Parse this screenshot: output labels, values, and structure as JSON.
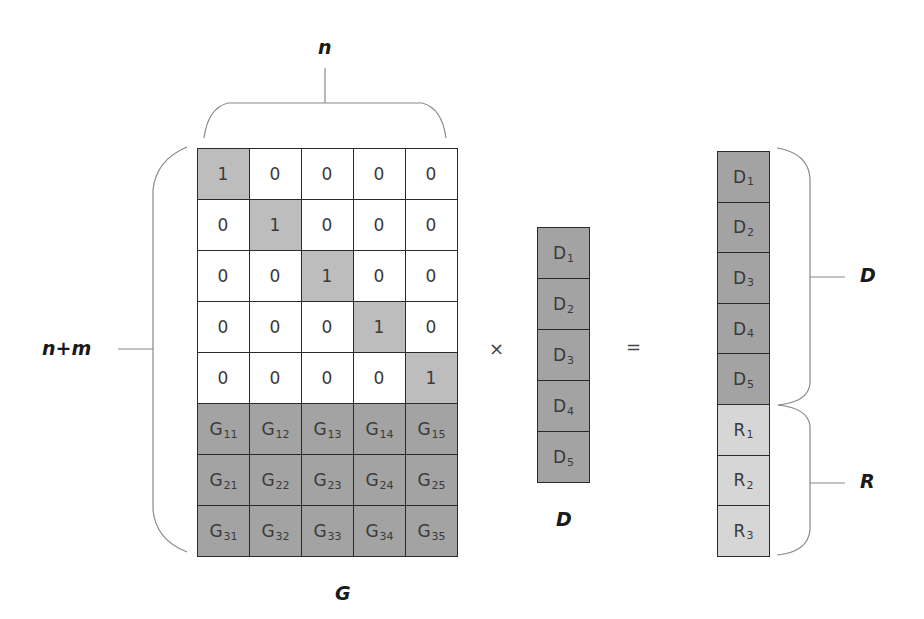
{
  "labels": {
    "n": "n",
    "n_plus_m": "n+m",
    "G": "G",
    "D_vector": "D",
    "D_brace": "D",
    "R_brace": "R",
    "times": "×",
    "equals": "="
  },
  "matrix_G": {
    "rows": [
      [
        {
          "t": "1",
          "s": ""
        },
        {
          "t": "0",
          "s": ""
        },
        {
          "t": "0",
          "s": ""
        },
        {
          "t": "0",
          "s": ""
        },
        {
          "t": "0",
          "s": ""
        }
      ],
      [
        {
          "t": "0",
          "s": ""
        },
        {
          "t": "1",
          "s": ""
        },
        {
          "t": "0",
          "s": ""
        },
        {
          "t": "0",
          "s": ""
        },
        {
          "t": "0",
          "s": ""
        }
      ],
      [
        {
          "t": "0",
          "s": ""
        },
        {
          "t": "0",
          "s": ""
        },
        {
          "t": "1",
          "s": ""
        },
        {
          "t": "0",
          "s": ""
        },
        {
          "t": "0",
          "s": ""
        }
      ],
      [
        {
          "t": "0",
          "s": ""
        },
        {
          "t": "0",
          "s": ""
        },
        {
          "t": "0",
          "s": ""
        },
        {
          "t": "1",
          "s": ""
        },
        {
          "t": "0",
          "s": ""
        }
      ],
      [
        {
          "t": "0",
          "s": ""
        },
        {
          "t": "0",
          "s": ""
        },
        {
          "t": "0",
          "s": ""
        },
        {
          "t": "0",
          "s": ""
        },
        {
          "t": "1",
          "s": ""
        }
      ],
      [
        {
          "t": "G",
          "s": "11"
        },
        {
          "t": "G",
          "s": "12"
        },
        {
          "t": "G",
          "s": "13"
        },
        {
          "t": "G",
          "s": "14"
        },
        {
          "t": "G",
          "s": "15"
        }
      ],
      [
        {
          "t": "G",
          "s": "21"
        },
        {
          "t": "G",
          "s": "22"
        },
        {
          "t": "G",
          "s": "23"
        },
        {
          "t": "G",
          "s": "24"
        },
        {
          "t": "G",
          "s": "25"
        }
      ],
      [
        {
          "t": "G",
          "s": "31"
        },
        {
          "t": "G",
          "s": "32"
        },
        {
          "t": "G",
          "s": "33"
        },
        {
          "t": "G",
          "s": "34"
        },
        {
          "t": "G",
          "s": "35"
        }
      ]
    ]
  },
  "vector_D": [
    {
      "t": "D",
      "s": "1"
    },
    {
      "t": "D",
      "s": "2"
    },
    {
      "t": "D",
      "s": "3"
    },
    {
      "t": "D",
      "s": "4"
    },
    {
      "t": "D",
      "s": "5"
    }
  ],
  "vector_result": [
    {
      "t": "D",
      "s": "1"
    },
    {
      "t": "D",
      "s": "2"
    },
    {
      "t": "D",
      "s": "3"
    },
    {
      "t": "D",
      "s": "4"
    },
    {
      "t": "D",
      "s": "5"
    },
    {
      "t": "R",
      "s": "1"
    },
    {
      "t": "R",
      "s": "2"
    },
    {
      "t": "R",
      "s": "3"
    }
  ],
  "colors": {
    "identity_one": "#bdbdbd",
    "identity_zero": "#ffffff",
    "generator": "#a3a3a3",
    "data": "#a3a3a3",
    "redundancy": "#d6d6d6",
    "border": "#2a2a2a"
  }
}
